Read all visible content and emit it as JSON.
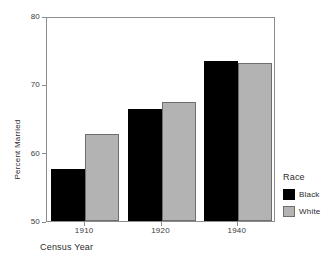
{
  "chart_data": {
    "type": "bar",
    "title": "",
    "xlabel": "Census Year",
    "ylabel": "Percent Married",
    "categories": [
      "1910",
      "1920",
      "1940"
    ],
    "series": [
      {
        "name": "Black",
        "color": "#000000",
        "values": [
          57.6,
          66.4,
          73.4
        ]
      },
      {
        "name": "White",
        "color": "#b3b3b3",
        "values": [
          62.7,
          67.4,
          73.1
        ]
      }
    ],
    "ylim": [
      50,
      80
    ],
    "yticks": [
      "50",
      "60",
      "70",
      "80"
    ],
    "xticks": [
      "1910",
      "1920",
      "1940"
    ],
    "grid": false,
    "legend": {
      "title": "Race",
      "position": "right",
      "entries": [
        {
          "label": "Black",
          "swatch": "black"
        },
        {
          "label": "White",
          "swatch": "gray"
        }
      ]
    },
    "frame_color": "#8d8d8d"
  }
}
